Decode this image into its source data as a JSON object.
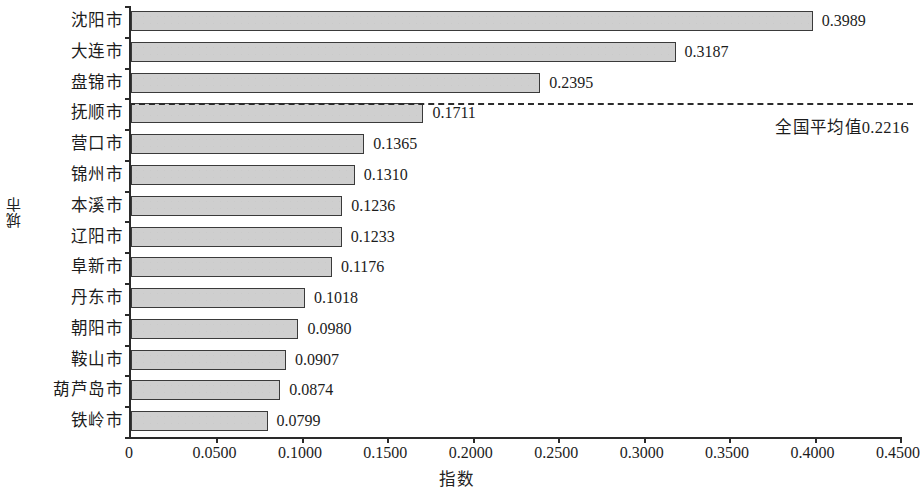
{
  "chart_data": {
    "type": "bar",
    "orientation": "horizontal",
    "title": "",
    "xlabel": "指数",
    "ylabel": "城市",
    "xlim": [
      0,
      0.45
    ],
    "xticks": [
      0,
      0.05,
      0.1,
      0.15,
      0.2,
      0.25,
      0.3,
      0.35,
      0.4,
      0.45
    ],
    "xtick_labels": [
      "0",
      "0.0500",
      "0.1000",
      "0.1500",
      "0.2000",
      "0.2500",
      "0.3000",
      "0.3500",
      "0.4000",
      "0.4500"
    ],
    "grid": false,
    "legend": false,
    "bar_fill_color": "#cfcfcf",
    "bar_edge_color": "#3a3a3a",
    "categories": [
      "沈阳市",
      "大连市",
      "盘锦市",
      "抚顺市",
      "营口市",
      "锦州市",
      "本溪市",
      "辽阳市",
      "阜新市",
      "丹东市",
      "朝阳市",
      "鞍山市",
      "葫芦岛市",
      "铁岭市"
    ],
    "values": [
      0.3989,
      0.3187,
      0.2395,
      0.1711,
      0.1365,
      0.131,
      0.1236,
      0.1233,
      0.1176,
      0.1018,
      0.098,
      0.0907,
      0.0874,
      0.0799
    ],
    "value_labels": [
      "0.3989",
      "0.3187",
      "0.2395",
      "0.1711",
      "0.1365",
      "0.1310",
      "0.1236",
      "0.1233",
      "0.1176",
      "0.1018",
      "0.0980",
      "0.0907",
      "0.0874",
      "0.0799"
    ],
    "annotations": [
      {
        "name": "national-average",
        "text": "全国平均值0.2216",
        "value": 0.2216,
        "style": "dashed-horizontal-line",
        "color": "#2b2b2b"
      }
    ]
  }
}
